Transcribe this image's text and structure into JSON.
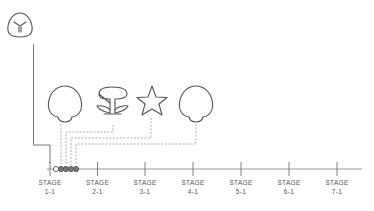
{
  "colors": {
    "stroke": "#555555",
    "dashed": "#9a9a9a",
    "axis": "#888888",
    "dot_fill": "#777777",
    "dot_hollow": "#ffffff",
    "label": "#555555"
  },
  "start_icon": {
    "name": "shield-badge-icon"
  },
  "items": [
    {
      "name": "mushroom",
      "icon": "mushroom-icon"
    },
    {
      "name": "flower",
      "icon": "flower-icon"
    },
    {
      "name": "star",
      "icon": "star-icon"
    },
    {
      "name": "mushroom",
      "icon": "mushroom-icon"
    }
  ],
  "progress_dots": {
    "hollow": 1,
    "filled": 4
  },
  "timeline": {
    "stages": [
      {
        "title": "STAGE",
        "number": "1-1"
      },
      {
        "title": "STAGE",
        "number": "2-1"
      },
      {
        "title": "STAGE",
        "number": "3-1"
      },
      {
        "title": "STAGE",
        "number": "4-1"
      },
      {
        "title": "STAGE",
        "number": "5-1"
      },
      {
        "title": "STAGE",
        "number": "6-1"
      },
      {
        "title": "STAGE",
        "number": "7-1"
      }
    ]
  }
}
